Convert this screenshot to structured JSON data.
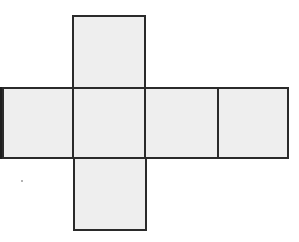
{
  "diagram": {
    "type": "cube-net",
    "colors": {
      "fill": "#eeeeee",
      "stroke": "#2a2a2a",
      "background": "#ffffff"
    },
    "faces": [
      {
        "id": "top",
        "col": 1,
        "row": 0
      },
      {
        "id": "left",
        "col": 0,
        "row": 1
      },
      {
        "id": "front",
        "col": 1,
        "row": 1
      },
      {
        "id": "right",
        "col": 2,
        "row": 1
      },
      {
        "id": "back",
        "col": 3,
        "row": 1
      },
      {
        "id": "bottom",
        "col": 1,
        "row": 2
      }
    ],
    "face_count": 6
  }
}
